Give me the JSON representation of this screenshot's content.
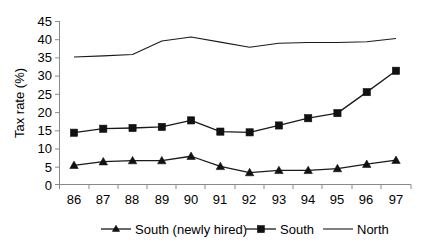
{
  "chart_data": {
    "type": "line",
    "title": "",
    "xlabel": "",
    "ylabel": "Tax rate (%)",
    "categories": [
      "86",
      "87",
      "88",
      "89",
      "90",
      "91",
      "92",
      "93",
      "94",
      "95",
      "96",
      "97"
    ],
    "ylim": [
      0,
      45
    ],
    "yticks": [
      0,
      5,
      10,
      15,
      20,
      25,
      30,
      35,
      40,
      45
    ],
    "grid": false,
    "legend_position": "bottom",
    "series": [
      {
        "name": "South (newly hired)",
        "marker": "triangle",
        "values": [
          5.3,
          6.3,
          6.6,
          6.6,
          7.8,
          5.0,
          3.3,
          3.9,
          3.9,
          4.4,
          5.6,
          6.7
        ]
      },
      {
        "name": "South",
        "marker": "square",
        "values": [
          14.3,
          15.4,
          15.6,
          15.9,
          17.7,
          14.6,
          14.4,
          16.3,
          18.3,
          19.7,
          25.5,
          31.4
        ]
      },
      {
        "name": "North",
        "marker": "none",
        "values": [
          35.2,
          35.5,
          35.9,
          39.6,
          40.7,
          39.3,
          37.9,
          39.0,
          39.2,
          39.2,
          39.4,
          40.3
        ]
      }
    ]
  },
  "axis": {
    "y_title": "Tax rate (%)",
    "y_tick_labels": [
      "45",
      "40",
      "35",
      "30",
      "25",
      "20",
      "15",
      "10",
      "5",
      "0"
    ],
    "x_tick_labels": [
      "86",
      "87",
      "88",
      "89",
      "90",
      "91",
      "92",
      "93",
      "94",
      "95",
      "96",
      "97"
    ]
  },
  "legend": {
    "items": [
      {
        "label": "South (newly hired)",
        "marker": "triangle-marker"
      },
      {
        "label": "South",
        "marker": "square-marker"
      },
      {
        "label": "North",
        "marker": "plain-line-marker"
      }
    ]
  },
  "colors": {
    "series": "#111111",
    "axis": "#8a8a8a",
    "background": "#ffffff"
  }
}
